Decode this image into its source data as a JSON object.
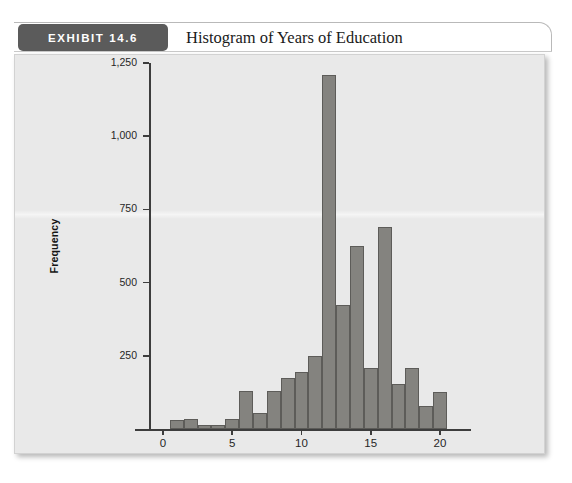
{
  "exhibit": {
    "badge_label": "EXHIBIT 14.6",
    "title": "Histogram of Years of Education"
  },
  "chart_data": {
    "type": "bar",
    "title": "Histogram of Years of Education",
    "xlabel": "Highest Year of School Completed",
    "ylabel": "Frequency",
    "xlim": [
      -1,
      21
    ],
    "ylim": [
      0,
      1250
    ],
    "grid": false,
    "legend": null,
    "xticks": [
      "0",
      "5",
      "10",
      "15",
      "20"
    ],
    "xtick_values": [
      0,
      5,
      10,
      15,
      20
    ],
    "yticks": [
      "250",
      "500",
      "750",
      "1,000",
      "1,250"
    ],
    "ytick_values": [
      250,
      500,
      750,
      1000,
      1250
    ],
    "categories": [
      0,
      1,
      2,
      3,
      4,
      5,
      6,
      7,
      8,
      9,
      10,
      11,
      12,
      13,
      14,
      15,
      16,
      17,
      18,
      19,
      20
    ],
    "values": [
      0,
      30,
      35,
      12,
      12,
      35,
      130,
      55,
      130,
      175,
      195,
      250,
      1210,
      425,
      625,
      210,
      690,
      155,
      210,
      80,
      125
    ],
    "bar_color": "#84837f",
    "bar_edge_color": "#5d5c59",
    "plot_background": "#e9e9e9"
  }
}
